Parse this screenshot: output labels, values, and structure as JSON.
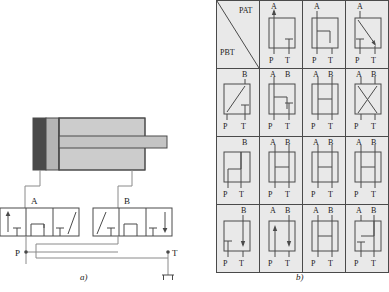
{
  "figure": {
    "caption_a": "a)",
    "caption_b": "b)"
  },
  "circuit": {
    "port_labels": {
      "A": "A",
      "B": "B",
      "P": "P",
      "T": "T"
    },
    "components": {
      "cylinder": "double-acting-cylinder",
      "valve_left": "3-position-4-way-valve",
      "valve_right": "3-position-4-way-valve",
      "tank": "tank-symbol"
    }
  },
  "symbol_table": {
    "header_cell": {
      "upper_label": "PAT",
      "lower_label": "PBT"
    },
    "port_labels": {
      "A": "A",
      "B": "B",
      "P": "P",
      "T": "T",
      "AB": [
        "A",
        "B"
      ],
      "PT": [
        "P",
        "T"
      ]
    },
    "rows": [
      {
        "row_label": "PAT",
        "cells": [
          {
            "top": "PAT / PBT",
            "bottom": "",
            "type": "diagonal-header"
          },
          {
            "top": "A",
            "bottom": "P T",
            "type": "arrow-up-p-to-a-blocked-t"
          },
          {
            "top": "A",
            "bottom": "P T",
            "type": "hook-right-blocked"
          },
          {
            "top": "A",
            "bottom": "P T",
            "type": "diagonal-down-right-blocked-p"
          }
        ]
      },
      {
        "cells": [
          {
            "top": "B",
            "bottom": "P T",
            "type": "diagonal-up-right-blocked-t"
          },
          {
            "top": "A B",
            "bottom": "P T",
            "type": "hook-right-blocked-t"
          },
          {
            "top": "A B",
            "bottom": "P T",
            "type": "h-crossbar"
          },
          {
            "top": "A B",
            "bottom": "P T",
            "type": "x-crossover"
          }
        ]
      },
      {
        "cells": [
          {
            "top": "B",
            "bottom": "P T",
            "type": "hook-left-up"
          },
          {
            "top": "A B",
            "bottom": "P T",
            "type": "h-crossbar-full"
          },
          {
            "top": "A B",
            "bottom": "P T",
            "type": "h-crossbar-full"
          },
          {
            "top": "A B",
            "bottom": "P T",
            "type": "h-crossbar-full"
          }
        ]
      },
      {
        "cells": [
          {
            "top": "B",
            "bottom": "P T",
            "type": "blocked-p-arrow-down-t"
          },
          {
            "top": "A B",
            "bottom": "P T",
            "type": "arrow-up-a-arrow-down-t"
          },
          {
            "top": "A B",
            "bottom": "P T",
            "type": "h-crossbar"
          },
          {
            "top": "A B",
            "bottom": "P T",
            "type": "hook-blocked-left"
          }
        ]
      }
    ]
  },
  "colors": {
    "line": "#4a4a4a",
    "panel": "#e9e9e9",
    "cylinder_body": "#c9c9c9",
    "cylinder_cap": "#4a4a4a",
    "cylinder_mid": "#a8a8a8"
  }
}
